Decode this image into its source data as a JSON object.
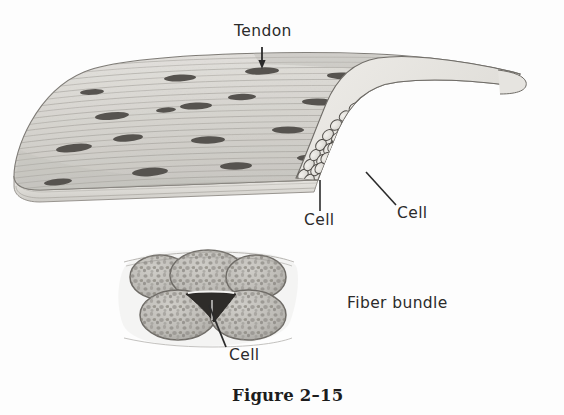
{
  "figure": {
    "caption": "Figure 2–15",
    "background_color": "#fdfdfd",
    "ink_color": "#2b2b2b"
  },
  "labels": {
    "tendon": "Tendon",
    "cell_surface": "Cell",
    "cell_edge": "Cell",
    "fiber_bundle": "Fiber bundle",
    "cell_section": "Cell"
  },
  "diagram": {
    "upper_illustration": {
      "name": "tendon slab perspective view",
      "description": "A thick sheet of tendon drawn in perspective, rounded at the left end, with longitudinal striations running left to right, dark lens-shaped tendon cells scattered over the surface, and a cut right edge revealing packed rounded fiber bundles in cross section.",
      "surface_fill": "#d8d6d1",
      "edge_fill": "#eceae6",
      "cell_fill": "#55534f",
      "striation_color": "#8d8a84",
      "striation_count": 26,
      "surface_cells": 23,
      "fiber_bundle_rows": 3,
      "fiber_bundles_per_row": 18
    },
    "lower_illustration": {
      "name": "fiber bundle cross section",
      "description": "Cross section through five rounded fiber bundles, three along the top and two below, each filled with a mottled granular texture; a flattened cell lies in the wedge-shaped space between bundles.",
      "bundle_fill": "#bdbbb6",
      "bundle_outline": "#6e6b66",
      "mottle_color": "#8f8c87",
      "bundle_count": 5,
      "upper_row_bundles": 3,
      "lower_row_bundles": 2
    }
  },
  "leaders": {
    "tendon_arrow": "downward arrow from Tendon label to tendon surface",
    "cell_surface_line": "line from Cell label up to a surface cell",
    "cell_edge_line": "line from Cell label up-left to a cut-edge fiber bundle",
    "cell_section_line": "line from Cell label up to the cell between bundles"
  }
}
